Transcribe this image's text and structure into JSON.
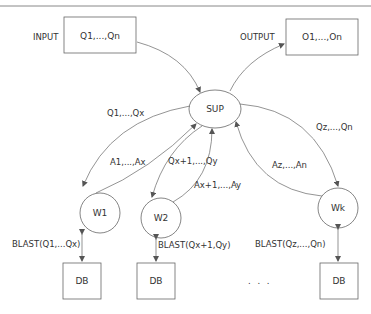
{
  "diagram": {
    "input_label": "INPUT",
    "input_box": "Q1,...,Qn",
    "output_label": "OUTPUT",
    "output_box": "O1,...,On",
    "supervisor": "SUP",
    "workers": [
      "W1",
      "W2",
      "Wk"
    ],
    "databases": [
      "DB",
      "DB",
      "DB"
    ],
    "edges": {
      "sup_to_w1": "Q1,...,Qx",
      "w1_to_sup": "A1,...,Ax",
      "sup_to_w2": "Qx+1,...,Qy",
      "w2_to_sup": "Ax+1,...,Ay",
      "sup_to_wk": "Qz,...,Qn",
      "wk_to_sup": "Az,...,An",
      "w1_db": "BLAST(Q1,...Qx)",
      "w2_db": "BLAST(Qx+1,Qy)",
      "wk_db": "BLAST(Qz,...,Qn)"
    },
    "ellipsis": ". . ."
  }
}
